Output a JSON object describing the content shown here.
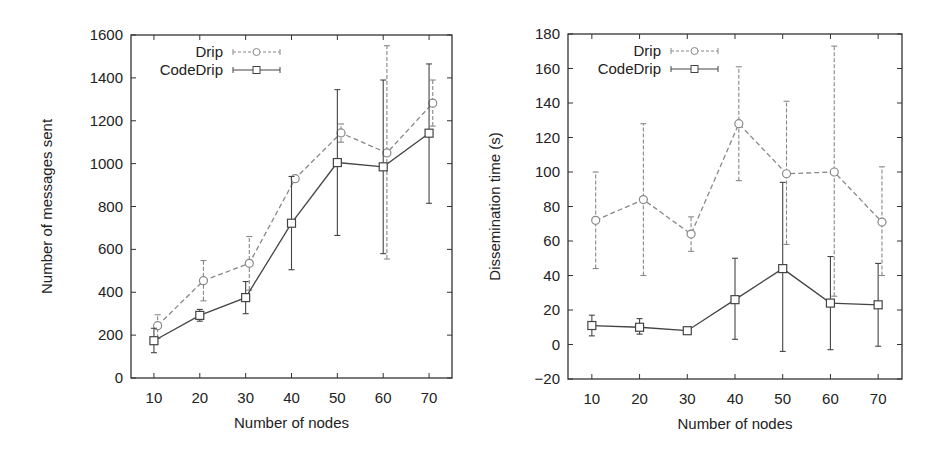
{
  "chart_data": [
    {
      "type": "line",
      "title": "",
      "xlabel": "Number of nodes",
      "ylabel": "Number of messages sent",
      "x": [
        10,
        20,
        30,
        40,
        50,
        60,
        70
      ],
      "xticks": [
        10,
        20,
        30,
        40,
        50,
        60,
        70
      ],
      "yticks": [
        0,
        200,
        400,
        600,
        800,
        1000,
        1200,
        1400,
        1600
      ],
      "xlim": [
        5,
        75
      ],
      "ylim": [
        0,
        1600
      ],
      "grid": false,
      "legend_position": "top-left",
      "error_bars": true,
      "series": [
        {
          "name": "Drip",
          "style": "dashed",
          "marker": "circle",
          "color": "#888888",
          "values": [
            244,
            454,
            535,
            930,
            1143,
            1050,
            1282
          ],
          "error_low": [
            185,
            360,
            410,
            920,
            1100,
            555,
            1175
          ],
          "error_high": [
            295,
            548,
            660,
            945,
            1185,
            1550,
            1390
          ]
        },
        {
          "name": "CodeDrip",
          "style": "solid",
          "marker": "square",
          "color": "#444444",
          "values": [
            174,
            292,
            375,
            722,
            1005,
            985,
            1142
          ],
          "error_low": [
            118,
            265,
            300,
            505,
            665,
            580,
            815
          ],
          "error_high": [
            232,
            320,
            450,
            940,
            1345,
            1390,
            1465
          ]
        }
      ]
    },
    {
      "type": "line",
      "title": "",
      "xlabel": "Number of nodes",
      "ylabel": "Dissemination time (s)",
      "x": [
        10,
        20,
        30,
        40,
        50,
        60,
        70
      ],
      "xticks": [
        10,
        20,
        30,
        40,
        50,
        60,
        70
      ],
      "yticks": [
        -20,
        0,
        20,
        40,
        60,
        80,
        100,
        120,
        140,
        160,
        180
      ],
      "xlim": [
        5,
        75
      ],
      "ylim": [
        -20,
        180
      ],
      "grid": false,
      "legend_position": "top-left",
      "error_bars": true,
      "series": [
        {
          "name": "Drip",
          "style": "dashed",
          "marker": "circle",
          "color": "#888888",
          "values": [
            72,
            84,
            64,
            128,
            99,
            100,
            71
          ],
          "error_low": [
            44,
            40,
            54,
            95,
            58,
            28,
            40
          ],
          "error_high": [
            100,
            128,
            74,
            161,
            141,
            173,
            103
          ]
        },
        {
          "name": "CodeDrip",
          "style": "solid",
          "marker": "square",
          "color": "#444444",
          "values": [
            11,
            10,
            8,
            26,
            44,
            24,
            23
          ],
          "error_low": [
            5,
            6,
            7,
            3,
            -4,
            -3,
            -1
          ],
          "error_high": [
            17,
            15,
            9,
            50,
            94,
            51,
            47
          ]
        }
      ]
    }
  ]
}
